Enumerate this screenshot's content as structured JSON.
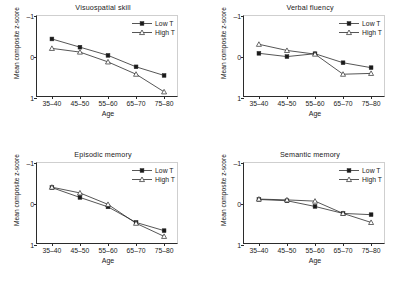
{
  "figure": {
    "panel_count": 4,
    "legend": [
      {
        "key": "low",
        "label": "Low T",
        "marker": "filled-square"
      },
      {
        "key": "high",
        "label": "High T",
        "marker": "open-triangle"
      }
    ],
    "axis": {
      "xlabel": "Age",
      "ylabel": "Mean composite z-score",
      "xticks": [
        "35–40",
        "45–50",
        "55–60",
        "65–70",
        "75–80"
      ],
      "yticks": [
        "1",
        "0",
        "–1"
      ]
    },
    "colors": {
      "line": "#2b2b2b",
      "marker_fill": "#1a1a1a",
      "marker_open": "#ffffff",
      "background": "#ffffff"
    }
  },
  "chart_data": [
    {
      "type": "line",
      "title": "Visuospatial skill",
      "xlabel": "Age",
      "ylabel": "Mean composite z-score",
      "categories": [
        "35–40",
        "45–50",
        "55–60",
        "65–70",
        "75–80"
      ],
      "ylim": [
        -1,
        1
      ],
      "yticks": [
        -1,
        0,
        1
      ],
      "grid": false,
      "legend_position": "top-right",
      "series": [
        {
          "name": "Low T",
          "marker": "filled-square",
          "values": [
            0.44,
            0.24,
            0.04,
            -0.24,
            -0.45
          ]
        },
        {
          "name": "High T",
          "marker": "open-triangle",
          "values": [
            0.21,
            0.12,
            -0.12,
            -0.42,
            -0.85
          ]
        }
      ]
    },
    {
      "type": "line",
      "title": "Verbal fluency",
      "xlabel": "Age",
      "ylabel": "Mean composite z-score",
      "categories": [
        "35–40",
        "45–50",
        "55–60",
        "65–70",
        "75–80"
      ],
      "ylim": [
        -1,
        1
      ],
      "yticks": [
        -1,
        0,
        1
      ],
      "grid": false,
      "legend_position": "top-right",
      "series": [
        {
          "name": "Low T",
          "marker": "filled-square",
          "values": [
            0.09,
            0.01,
            0.08,
            -0.14,
            -0.26
          ]
        },
        {
          "name": "High T",
          "marker": "open-triangle",
          "values": [
            0.31,
            0.16,
            0.07,
            -0.42,
            -0.4
          ]
        }
      ]
    },
    {
      "type": "line",
      "title": "Episodic memory",
      "xlabel": "Age",
      "ylabel": "Mean composite z-score",
      "categories": [
        "35–40",
        "45–50",
        "55–60",
        "65–70",
        "75–80"
      ],
      "ylim": [
        -1,
        1
      ],
      "yticks": [
        -1,
        0,
        1
      ],
      "grid": false,
      "legend_position": "top-right",
      "series": [
        {
          "name": "Low T",
          "marker": "filled-square",
          "values": [
            0.4,
            0.16,
            -0.07,
            -0.45,
            -0.65
          ]
        },
        {
          "name": "High T",
          "marker": "open-triangle",
          "values": [
            0.41,
            0.27,
            -0.01,
            -0.47,
            -0.79
          ]
        }
      ]
    },
    {
      "type": "line",
      "title": "Semantic memory",
      "xlabel": "Age",
      "ylabel": "Mean composite z-score",
      "categories": [
        "35–40",
        "45–50",
        "55–60",
        "65–70",
        "75–80"
      ],
      "ylim": [
        -1,
        1
      ],
      "yticks": [
        -1,
        0,
        1
      ],
      "grid": false,
      "legend_position": "top-right",
      "series": [
        {
          "name": "Low T",
          "marker": "filled-square",
          "values": [
            0.11,
            0.08,
            -0.06,
            -0.23,
            -0.26
          ]
        },
        {
          "name": "High T",
          "marker": "open-triangle",
          "values": [
            0.12,
            0.1,
            0.07,
            -0.23,
            -0.45
          ]
        }
      ]
    }
  ]
}
